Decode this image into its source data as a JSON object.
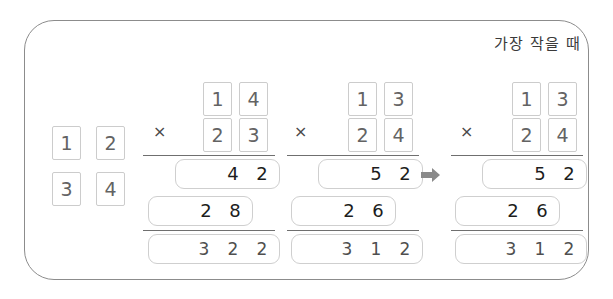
{
  "heading": "가장 작을 때",
  "pool": {
    "label": "digit-tiles-pool",
    "tiles": [
      "1",
      "2",
      "3",
      "4"
    ]
  },
  "arrow": {
    "glyph": "➡",
    "color": "#8a8a8a"
  },
  "columns": [
    {
      "name": "problem-1",
      "operator": "×",
      "multiplicand": [
        "1",
        "4"
      ],
      "multiplier": [
        "2",
        "3"
      ],
      "partial1": [
        "4",
        "2"
      ],
      "partial2": [
        "2",
        "8"
      ],
      "total": [
        "3",
        "2",
        "2"
      ]
    },
    {
      "name": "problem-2",
      "operator": "×",
      "multiplicand": [
        "1",
        "3"
      ],
      "multiplier": [
        "2",
        "4"
      ],
      "partial1": [
        "5",
        "2"
      ],
      "partial2": [
        "2",
        "6"
      ],
      "total": [
        "3",
        "1",
        "2"
      ]
    },
    {
      "name": "problem-3",
      "operator": "×",
      "multiplicand": [
        "1",
        "3"
      ],
      "multiplier": [
        "2",
        "4"
      ],
      "partial1": [
        "5",
        "2"
      ],
      "partial2": [
        "2",
        "6"
      ],
      "total": [
        "3",
        "1",
        "2"
      ]
    }
  ]
}
